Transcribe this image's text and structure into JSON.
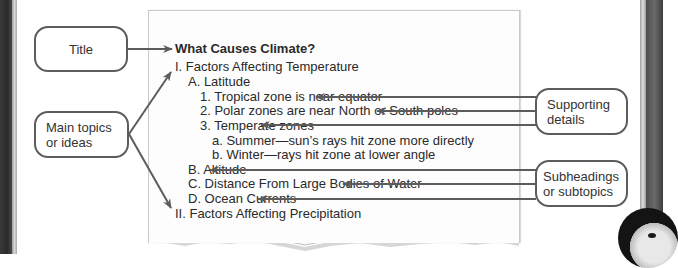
{
  "labels": {
    "title": "Title",
    "main_topics": [
      "Main topics",
      "or ideas"
    ],
    "supporting_details": [
      "Supporting",
      "details"
    ],
    "subheadings": [
      "Subheadings",
      "or subtopics"
    ]
  },
  "outline": {
    "title": "What Causes Climate?",
    "lines": [
      {
        "text": "I. Factors Affecting Temperature",
        "level": 0
      },
      {
        "text": "A. Latitude",
        "level": 1
      },
      {
        "text": "1. Tropical zone is near equator",
        "level": 2
      },
      {
        "text": "2. Polar zones are near North or South poles",
        "level": 2
      },
      {
        "text": "3. Temperate zones",
        "level": 2
      },
      {
        "text": "a. Summer—sun’s rays hit zone more directly",
        "level": 3
      },
      {
        "text": "b. Winter—rays hit zone at lower angle",
        "level": 3
      },
      {
        "text": "B. Altitude",
        "level": 1
      },
      {
        "text": "C. Distance From Large Bodies of Water",
        "level": 1
      },
      {
        "text": "D. Ocean Currents",
        "level": 1
      },
      {
        "text": "II. Factors Affecting Precipitation",
        "level": 0
      }
    ]
  },
  "colors": {
    "arrow": "#5c5c5c",
    "text": "#2a2a2a",
    "paper": "#fdfdfd"
  }
}
